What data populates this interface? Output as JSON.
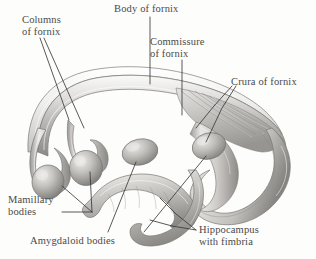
{
  "figure": {
    "background_color": "#fdfdfc",
    "label_color": "#4a4a4a",
    "leader_line_color": "#3b3b3b"
  },
  "labels": {
    "columns_of_fornix": "Columns\nof fornix",
    "body_of_fornix": "Body of fornix",
    "commissure_of_fornix": "Commissure\nof fornix",
    "crura_of_fornix": "Crura of fornix",
    "mamillary_bodies": "Mamillary\nbodies",
    "amygdaloid_bodies": "Amygdaloid bodies",
    "hippocampus_with_fimbria": "Hippocampus\nwith fimbria"
  },
  "structures": [
    {
      "name": "body-of-fornix",
      "description": "arched band across the top of the figure"
    },
    {
      "name": "commissure-of-fornix",
      "description": "striated fan-shaped region on the right of the arch"
    },
    {
      "name": "crura-of-fornix",
      "description": "paired posterior limbs curving down on the right"
    },
    {
      "name": "columns-of-fornix",
      "description": "paired anterior limbs descending on the left"
    },
    {
      "name": "mamillary-bodies",
      "description": "two rounded bulbs at the lower end of the columns"
    },
    {
      "name": "amygdaloid-bodies",
      "description": "two ovoid masses in the lower center"
    },
    {
      "name": "hippocampus-with-fimbria",
      "description": "curved elongated bodies at the lower right"
    }
  ],
  "palette": {
    "tissue_light": "#f1f0ee",
    "tissue_mid": "#c9c7c4",
    "tissue_dark": "#8e8c89",
    "tissue_shadow": "#6e6c6a",
    "outline": "#6b6966"
  }
}
